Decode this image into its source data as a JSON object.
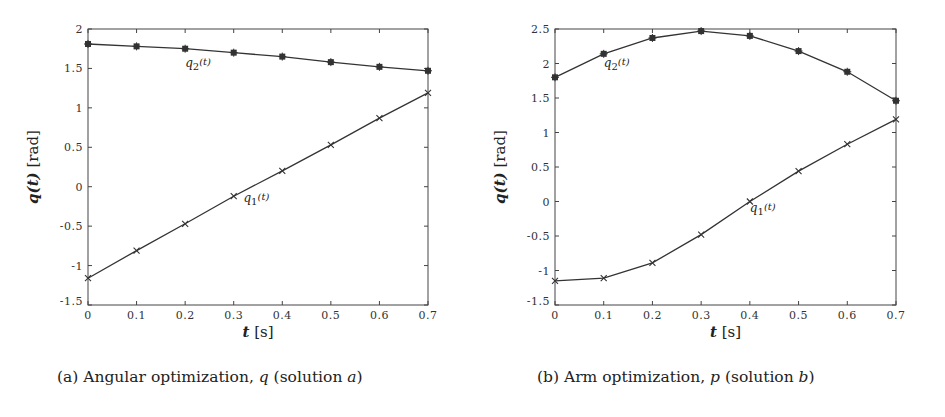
{
  "chart_data": [
    {
      "type": "line",
      "panel": "a",
      "caption": "(a) Angular optimization, q (solution a)",
      "title": "",
      "xlabel": "t [s]",
      "ylabel": "q(t) [rad]",
      "xlim": [
        0,
        0.7
      ],
      "ylim": [
        -1.5,
        2
      ],
      "xticks": [
        "0",
        "0.1",
        "0.2",
        "0.3",
        "0.4",
        "0.5",
        "0.6",
        "0.7"
      ],
      "yticks": [
        "-1.5",
        "-1",
        "-0.5",
        "0",
        "0.5",
        "1",
        "1.5",
        "2"
      ],
      "grid": false,
      "legend": "none (inline labels)",
      "x": [
        0,
        0.1,
        0.2,
        0.3,
        0.4,
        0.5,
        0.6,
        0.7
      ],
      "series": [
        {
          "name": "q1(t)",
          "marker": "x",
          "values": [
            -1.16,
            -0.81,
            -0.47,
            -0.12,
            0.2,
            0.53,
            0.87,
            1.19
          ]
        },
        {
          "name": "q2(t)",
          "marker": "*",
          "values": [
            1.81,
            1.78,
            1.75,
            1.7,
            1.65,
            1.58,
            1.52,
            1.47
          ]
        }
      ],
      "annotations": [
        {
          "text": "q2(t)",
          "x": 0.2,
          "y": 1.52
        },
        {
          "text": "q1(t)",
          "x": 0.32,
          "y": -0.2
        }
      ]
    },
    {
      "type": "line",
      "panel": "b",
      "caption": "(b) Arm optimization, p (solution b)",
      "title": "",
      "xlabel": "t [s]",
      "ylabel": "q(t) [rad]",
      "xlim": [
        0,
        0.7
      ],
      "ylim": [
        -1.5,
        2.5
      ],
      "xticks": [
        "0",
        "0.1",
        "0.2",
        "0.3",
        "0.4",
        "0.5",
        "0.6",
        "0.7"
      ],
      "yticks": [
        "-1.5",
        "-1",
        "-0.5",
        "0",
        "0.5",
        "1",
        "1.5",
        "2",
        "2.5"
      ],
      "grid": false,
      "legend": "none (inline labels)",
      "x": [
        0,
        0.1,
        0.2,
        0.3,
        0.4,
        0.5,
        0.6,
        0.7
      ],
      "series": [
        {
          "name": "q1(t)",
          "marker": "x",
          "values": [
            -1.15,
            -1.11,
            -0.89,
            -0.48,
            0.0,
            0.44,
            0.83,
            1.19
          ]
        },
        {
          "name": "q2(t)",
          "marker": "*",
          "values": [
            1.8,
            2.14,
            2.37,
            2.47,
            2.4,
            2.18,
            1.88,
            1.46
          ]
        }
      ],
      "annotations": [
        {
          "text": "q2(t)",
          "x": 0.1,
          "y": 1.95
        },
        {
          "text": "q1(t)",
          "x": 0.4,
          "y": -0.15
        }
      ]
    }
  ],
  "panels": {
    "a": {
      "caption_prefix": "(a) Angular optimization, ",
      "caption_var": "q",
      "caption_mid": " (solution ",
      "caption_sol": "a",
      "caption_end": ")",
      "xlabel_var": "t",
      "xlabel_unit": " [s]",
      "ylabel_var": "q(t)",
      "ylabel_unit": " [rad]",
      "q1_label": "q",
      "q1_sub": "1",
      "q2_label": "q",
      "q2_sub": "2",
      "arg": "(t)"
    },
    "b": {
      "caption_prefix": "(b) Arm optimization, ",
      "caption_var": "p",
      "caption_mid": " (solution ",
      "caption_sol": "b",
      "caption_end": ")",
      "xlabel_var": "t",
      "xlabel_unit": " [s]",
      "ylabel_var": "q(t)",
      "ylabel_unit": " [rad]",
      "q1_label": "q",
      "q1_sub": "1",
      "q2_label": "q",
      "q2_sub": "2",
      "arg": "(t)"
    }
  },
  "colors": {
    "line": "#333333",
    "axis": "#444444",
    "background": "#ffffff"
  }
}
